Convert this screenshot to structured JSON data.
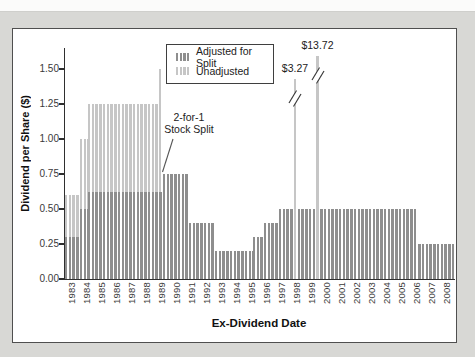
{
  "page": {
    "background": "#d8d8d5",
    "panel_background": "#ffffff"
  },
  "chart_data": {
    "type": "bar",
    "title": "",
    "xlabel": "Ex-Dividend Date",
    "ylabel": "Dividend per Share ($)",
    "ylim": [
      0,
      1.65
    ],
    "grid": false,
    "legend_position": "top-center",
    "yticks": [
      "0.00",
      "0.25",
      "0.50",
      "0.75",
      "1.00",
      "1.25",
      "1.50"
    ],
    "years": [
      "1983",
      "1984",
      "1985",
      "1986",
      "1987",
      "1988",
      "1989",
      "1990",
      "1991",
      "1992",
      "1993",
      "1994",
      "1995",
      "1996",
      "1997",
      "1998",
      "1999",
      "2000",
      "2001",
      "2002",
      "2003",
      "2004",
      "2005",
      "2006",
      "2007",
      "2008"
    ],
    "quarters_per_year": 4,
    "colors": {
      "adjusted": "#8e8e8e",
      "unadjusted": "#c6c6c6"
    },
    "legend": [
      {
        "key": "adjusted",
        "label": "Adjusted for Split"
      },
      {
        "key": "unadjusted",
        "label": "Unadjusted"
      }
    ],
    "series": [
      {
        "key": "unadjusted",
        "name": "Unadjusted",
        "segments": [
          {
            "from_q": 0,
            "to_q": 4,
            "value": 0.6
          },
          {
            "from_q": 4,
            "to_q": 6,
            "value": 1.0
          },
          {
            "from_q": 6,
            "to_q": 25,
            "value": 1.25
          },
          {
            "from_q": 25,
            "to_q": 26,
            "value": 1.5
          }
        ]
      },
      {
        "key": "adjusted",
        "name": "Adjusted for Split",
        "segments": [
          {
            "from_q": 0,
            "to_q": 4,
            "value": 0.3
          },
          {
            "from_q": 4,
            "to_q": 6,
            "value": 0.5
          },
          {
            "from_q": 6,
            "to_q": 26,
            "value": 0.625
          },
          {
            "from_q": 26,
            "to_q": 33,
            "value": 0.75
          },
          {
            "from_q": 33,
            "to_q": 40,
            "value": 0.4
          },
          {
            "from_q": 40,
            "to_q": 50,
            "value": 0.2
          },
          {
            "from_q": 50,
            "to_q": 53,
            "value": 0.3
          },
          {
            "from_q": 53,
            "to_q": 57,
            "value": 0.4
          },
          {
            "from_q": 57,
            "to_q": 94,
            "value": 0.5
          },
          {
            "from_q": 94,
            "to_q": 104,
            "value": 0.25
          }
        ]
      }
    ],
    "special_dividends": [
      {
        "label": "$3.27",
        "year": "1998",
        "quarter": 61,
        "display_height": 1.43
      },
      {
        "label": "$13.72",
        "year": "1999",
        "quarter": 67,
        "display_height": 1.59
      }
    ],
    "annotation": {
      "line1": "2-for-1",
      "line2": "Stock Split"
    }
  }
}
